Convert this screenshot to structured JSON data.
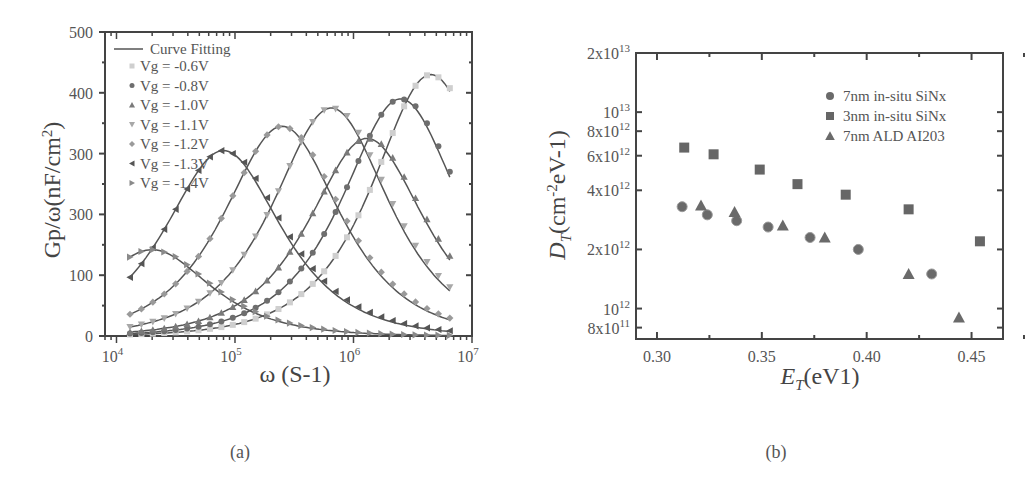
{
  "figure": {
    "panel_a_caption": "(a)",
    "panel_b_caption": "(b)"
  },
  "colors": {
    "axis": "#444444",
    "fit_line": "#555555",
    "marker_dark": "#666666",
    "marker_mid": "#888888",
    "marker_light": "#c8c8c8"
  },
  "chart_data": [
    {
      "type": "scatter",
      "panel": "(a)",
      "title": "",
      "xlabel": "ω (S-1)",
      "ylabel": "Gp/ω(nF/cm2)",
      "xscale": "log",
      "xlim": [
        8000,
        10000000
      ],
      "ylim": [
        0,
        500
      ],
      "x_ticks": [
        "10^4",
        "10^5",
        "10^6",
        "10^7"
      ],
      "y_ticks": [
        "0",
        "100",
        "300",
        "300",
        "400",
        "500"
      ],
      "grid": false,
      "legend_position": "upper left",
      "legend": [
        "Curve Fitting",
        "Vg = -0.6V",
        "Vg = -0.8V",
        "Vg = -1.0V",
        "Vg = -1.1V",
        "Vg = -1.2V",
        "Vg = -1.3V",
        "Vg = -1.4V"
      ],
      "series": [
        {
          "name": "Vg = -0.6V",
          "marker": "square",
          "peak_x": 4500000,
          "peak_y": 430
        },
        {
          "name": "Vg = -0.8V",
          "marker": "circle",
          "peak_x": 2500000,
          "peak_y": 390
        },
        {
          "name": "Vg = -1.0V",
          "marker": "triangle-up",
          "peak_x": 1300000,
          "peak_y": 325
        },
        {
          "name": "Vg = -1.1V",
          "marker": "triangle-down",
          "peak_x": 650000,
          "peak_y": 375
        },
        {
          "name": "Vg = -1.2V",
          "marker": "diamond",
          "peak_x": 250000,
          "peak_y": 345
        },
        {
          "name": "Vg = -1.3V",
          "marker": "triangle-left",
          "peak_x": 80000,
          "peak_y": 305
        },
        {
          "name": "Vg = -1.4V",
          "marker": "triangle-right",
          "peak_x": 20000,
          "peak_y": 142
        }
      ]
    },
    {
      "type": "scatter",
      "panel": "(b)",
      "title": "",
      "xlabel": "E_T(eV1)",
      "ylabel": "D_T(cm-2eV-1)",
      "yscale": "log",
      "xlim": [
        0.29,
        0.465
      ],
      "ylim": [
        700000000000.0,
        20000000000000.0
      ],
      "x_ticks": [
        "0.30",
        "0.35",
        "0.40",
        "0.45"
      ],
      "y_ticks": [
        "8x10^11",
        "10^12",
        "2x10^12",
        "4x10^12",
        "6x10^12",
        "8x10^12",
        "10^13",
        "2x10^13"
      ],
      "grid": false,
      "legend_position": "upper right",
      "series": [
        {
          "name": "7nm in-situ SiNx",
          "marker": "circle",
          "x": [
            0.312,
            0.324,
            0.338,
            0.353,
            0.373,
            0.396,
            0.431
          ],
          "y": [
            3300000000000.0,
            3000000000000.0,
            2800000000000.0,
            2600000000000.0,
            2300000000000.0,
            2000000000000.0,
            1500000000000.0
          ]
        },
        {
          "name": "3nm in-situ SiNx",
          "marker": "square",
          "x": [
            0.313,
            0.327,
            0.349,
            0.367,
            0.39,
            0.42,
            0.454
          ],
          "y": [
            6600000000000.0,
            6100000000000.0,
            5100000000000.0,
            4300000000000.0,
            3800000000000.0,
            3200000000000.0,
            2200000000000.0
          ]
        },
        {
          "name": "7nm ALD AI203",
          "marker": "triangle-up",
          "x": [
            0.321,
            0.337,
            0.36,
            0.38,
            0.42,
            0.444
          ],
          "y": [
            3350000000000.0,
            3100000000000.0,
            2650000000000.0,
            2300000000000.0,
            1500000000000.0,
            900000000000.0
          ]
        }
      ]
    }
  ],
  "panel_a": {
    "y_tick_labels": [
      "0",
      "100",
      "300",
      "300",
      "400",
      "500"
    ],
    "x_tick_labels": [
      {
        "base": "10",
        "exp": "4"
      },
      {
        "base": "10",
        "exp": "5"
      },
      {
        "base": "10",
        "exp": "6"
      },
      {
        "base": "10",
        "exp": "7"
      }
    ],
    "ylabel_main": "Gp/ω(nF/cm",
    "ylabel_sup": "2",
    "ylabel_end": ")",
    "xlabel": "ω (S-1)",
    "legend": {
      "fit_label": "Curve Fitting",
      "items": [
        "Vg = -0.6V",
        "Vg = -0.8V",
        "Vg = -1.0V",
        "Vg = -1.1V",
        "Vg = -1.2V",
        "Vg = -1.3V",
        "Vg = -1.4V"
      ]
    }
  },
  "panel_b": {
    "y_tick_labels": [
      {
        "mant": "8x10",
        "exp": "11"
      },
      {
        "mant": "10",
        "exp": "12"
      },
      {
        "mant": "2x10",
        "exp": "12"
      },
      {
        "mant": "4x10",
        "exp": "12"
      },
      {
        "mant": "6x10",
        "exp": "12"
      },
      {
        "mant": "8x10",
        "exp": "12"
      },
      {
        "mant": "10",
        "exp": "13"
      },
      {
        "mant": "2x10",
        "exp": "13"
      }
    ],
    "x_tick_labels": [
      "0.30",
      "0.35",
      "0.40",
      "0.45"
    ],
    "ylabel_D": "D",
    "ylabel_sub": "T",
    "ylabel_rest": "(cm",
    "ylabel_sup": "-2",
    "ylabel_end": "eV-1)",
    "xlabel_E": "E",
    "xlabel_sub": "T",
    "xlabel_rest": "(eV1)",
    "legend": [
      "7nm in-situ SiNx",
      "3nm in-situ SiNx",
      "7nm ALD AI203"
    ]
  }
}
